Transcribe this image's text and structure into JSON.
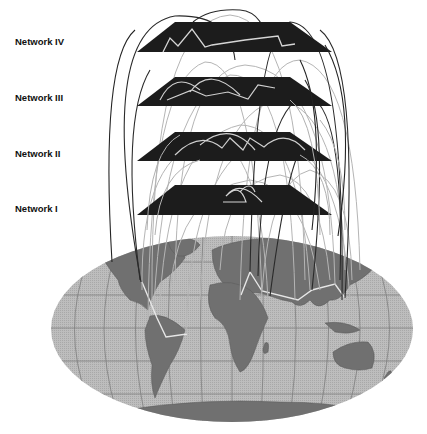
{
  "diagram": {
    "layers": [
      {
        "id": "network-iv",
        "label": "Network IV",
        "label_y": 36
      },
      {
        "id": "network-iii",
        "label": "Network III",
        "label_y": 92
      },
      {
        "id": "network-ii",
        "label": "Network II",
        "label_y": 148
      },
      {
        "id": "network-i",
        "label": "Network I",
        "label_y": 203
      }
    ],
    "base": {
      "label": "",
      "type": "world-map",
      "projection": "robinson-like"
    },
    "colors": {
      "plate": "#1c1c1c",
      "plate_link": "#d8d8d8",
      "inter_layer_dark": "#222222",
      "inter_layer_light": "#b0b0b0",
      "ocean": "#b4b4b4",
      "land": "#6e6e6e",
      "graticule": "#7a7a7a",
      "map_route": "#e0e0e0"
    }
  }
}
